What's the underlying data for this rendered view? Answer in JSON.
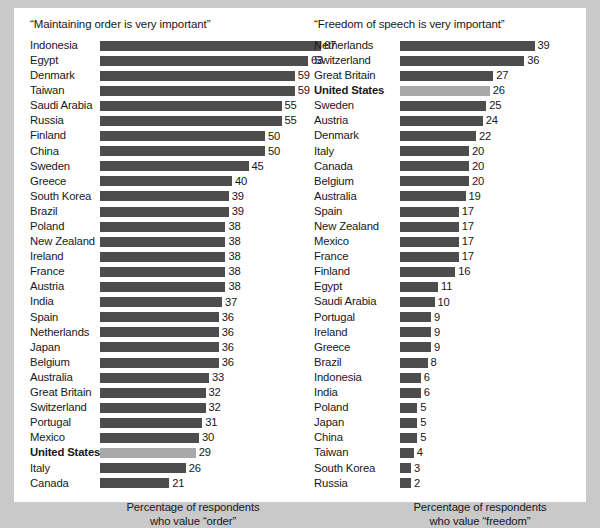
{
  "figure": {
    "background_color": "#ffffff",
    "page_background_color": "#c9c9c9",
    "bar_color": "#4d4d4d",
    "highlight_color": "#a9a9a9",
    "highlight_label": "United States"
  },
  "chart_data": [
    {
      "type": "bar",
      "title": "“Maintaining order is very important”",
      "orientation": "horizontal",
      "xlabel": "Percentage of respondents who value “order”",
      "ylabel": "",
      "xlim": [
        0,
        67
      ],
      "grid": false,
      "legend": "none",
      "caption_line1": "Percentage of respondents",
      "caption_line2": "who value “order”",
      "categories": [
        "Indonesia",
        "Egypt",
        "Denmark",
        "Taiwan",
        "Saudi Arabia",
        "Russia",
        "Finland",
        "China",
        "Sweden",
        "Greece",
        "South Korea",
        "Brazil",
        "Poland",
        "New Zealand",
        "Ireland",
        "France",
        "Austria",
        "India",
        "Spain",
        "Netherlands",
        "Japan",
        "Belgium",
        "Australia",
        "Great Britain",
        "Switzerland",
        "Portugal",
        "Mexico",
        "United States",
        "Italy",
        "Canada"
      ],
      "values": [
        67,
        63,
        59,
        59,
        55,
        55,
        50,
        50,
        45,
        40,
        39,
        39,
        38,
        38,
        38,
        38,
        38,
        37,
        36,
        36,
        36,
        36,
        33,
        32,
        32,
        31,
        30,
        29,
        26,
        21
      ],
      "highlighted": [
        "United States"
      ]
    },
    {
      "type": "bar",
      "title": "“Freedom of speech is very important”",
      "orientation": "horizontal",
      "xlabel": "Percentage of respondents who value “freedom”",
      "ylabel": "",
      "xlim": [
        0,
        39
      ],
      "grid": false,
      "legend": "none",
      "caption_line1": "Percentage of respondents",
      "caption_line2": "who value “freedom”",
      "categories": [
        "Netherlands",
        "Switzerland",
        "Great Britain",
        "United States",
        "Sweden",
        "Austria",
        "Denmark",
        "Italy",
        "Canada",
        "Belgium",
        "Australia",
        "Spain",
        "New Zealand",
        "Mexico",
        "France",
        "Finland",
        "Egypt",
        "Saudi Arabia",
        "Portugal",
        "Ireland",
        "Greece",
        "Brazil",
        "Indonesia",
        "India",
        "Poland",
        "Japan",
        "China",
        "Taiwan",
        "South Korea",
        "Russia"
      ],
      "values": [
        39,
        36,
        27,
        26,
        25,
        24,
        22,
        20,
        20,
        20,
        19,
        17,
        17,
        17,
        17,
        16,
        11,
        10,
        9,
        9,
        9,
        8,
        6,
        6,
        5,
        5,
        5,
        4,
        3,
        2
      ],
      "highlighted": [
        "United States"
      ]
    }
  ]
}
